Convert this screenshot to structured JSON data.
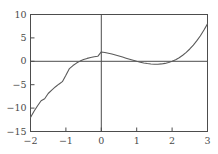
{
  "chart_data": {
    "type": "line",
    "title": "",
    "subtitle": "",
    "xlabel": "",
    "ylabel": "",
    "xlim": [
      -2,
      3
    ],
    "ylim": [
      -15,
      10
    ],
    "grid": false,
    "legend": null,
    "axis_lines": {
      "x_axis_at_y": 0,
      "y_axis_at_x": 0
    },
    "x_ticks": [
      -2,
      -1,
      0,
      1,
      2,
      3
    ],
    "x_tick_labels": [
      "−2",
      "−1",
      "0",
      "1",
      "2",
      "3"
    ],
    "y_ticks": [
      -15,
      -10,
      -5,
      0,
      5,
      10
    ],
    "y_tick_labels": [
      "−15",
      "−10",
      "−5",
      "0",
      "5",
      "10"
    ],
    "series": [
      {
        "name": "cubic",
        "expression": "x^3 - 2x^2 - x + 2",
        "color": "#5a5a5a",
        "linewidth": 1.1,
        "x": [
          -2.0,
          -1.9,
          -1.8,
          -1.7,
          -1.6,
          -1.5,
          -1.4,
          -1.3,
          -1.2,
          -1.1,
          -1.0,
          -0.9,
          -0.8,
          -0.7,
          -0.6,
          -0.5,
          -0.4,
          -0.3,
          -0.2,
          -0.1,
          0.0,
          0.1,
          0.2,
          0.3,
          0.4,
          0.5,
          0.6,
          0.7,
          0.8,
          0.9,
          1.0,
          1.1,
          1.2,
          1.3,
          1.4,
          1.5,
          1.6,
          1.7,
          1.8,
          1.9,
          2.0,
          2.1,
          2.2,
          2.3,
          2.4,
          2.5,
          2.6,
          2.7,
          2.8,
          2.9,
          3.0
        ],
        "y": [
          -12.0,
          -10.68,
          -9.5,
          -8.43,
          -8.0,
          -6.88,
          -6.14,
          -5.48,
          -4.89,
          -4.35,
          -3.0,
          -1.55,
          -0.91,
          -0.38,
          0.04,
          0.38,
          0.62,
          0.83,
          0.97,
          1.07,
          2.0,
          1.88,
          1.73,
          1.55,
          1.34,
          1.13,
          0.9,
          0.66,
          0.43,
          0.21,
          0.0,
          -0.19,
          -0.35,
          -0.48,
          -0.58,
          -0.63,
          -0.62,
          -0.56,
          -0.45,
          -0.26,
          0.0,
          0.34,
          0.77,
          1.29,
          1.9,
          2.63,
          3.46,
          4.41,
          5.47,
          6.67,
          8.0
        ]
      }
    ],
    "key_points": {
      "roots": [
        -1,
        1,
        2
      ],
      "local_max": {
        "x": -0.2,
        "y": 2.0
      },
      "local_min": {
        "x": 1.55,
        "y": -0.63
      },
      "endpoints": [
        {
          "x": -2,
          "y": -12
        },
        {
          "x": 3,
          "y": 8
        }
      ]
    },
    "colors": {
      "curve": "#5a5a5a",
      "frame": "#4d4d4d",
      "axis": "#4d4d4d",
      "tick_text": "#4a4a4a",
      "background": "#ffffff"
    }
  }
}
